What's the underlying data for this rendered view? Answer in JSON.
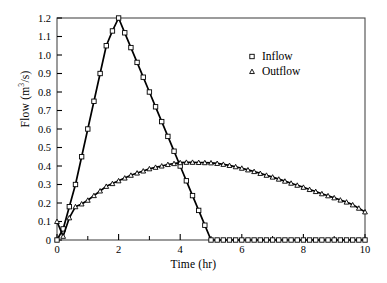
{
  "figure": {
    "background": "#ffffff",
    "foreground": "#000000"
  },
  "axis_labels": {
    "x": "Time (hr)",
    "y_prefix": "Flow (m",
    "y_exponent": "3",
    "y_suffix": "/s)",
    "y_full": "Flow (m3/s)"
  },
  "ticks": {
    "x_major": [
      "0",
      "2",
      "4",
      "6",
      "8",
      "10"
    ],
    "x_major_values": [
      0,
      2,
      4,
      6,
      8,
      10
    ],
    "x_minor_values": [
      1,
      3,
      5,
      7,
      9
    ],
    "y_major": [
      "0",
      "0.1",
      "0.2",
      "0.3",
      "0.4",
      "0.5",
      "0.6",
      "0.7",
      "0.8",
      "0.9",
      "1.0",
      "1.1",
      "1.2"
    ],
    "y_major_values": [
      0,
      0.1,
      0.2,
      0.3,
      0.4,
      0.5,
      0.6,
      0.7,
      0.8,
      0.9,
      1.0,
      1.1,
      1.2
    ]
  },
  "legend": {
    "position": "top-right-inside",
    "entries": [
      {
        "label": "Inflow",
        "marker": "square-marker"
      },
      {
        "label": "Outflow",
        "marker": "triangle-marker"
      }
    ]
  },
  "chart_data": {
    "type": "line",
    "title": "",
    "subtitle": "",
    "xlabel": "Time (hr)",
    "ylabel": "Flow (m3/s)",
    "xlim": [
      0,
      10
    ],
    "ylim": [
      0,
      1.2
    ],
    "grid": false,
    "legend_position": "top-right-inside",
    "x": [
      0,
      0.2,
      0.4,
      0.6,
      0.8,
      1.0,
      1.2,
      1.4,
      1.6,
      1.8,
      2.0,
      2.2,
      2.4,
      2.6,
      2.8,
      3.0,
      3.2,
      3.4,
      3.6,
      3.8,
      4.0,
      4.2,
      4.4,
      4.6,
      4.8,
      5.0,
      5.2,
      5.4,
      5.6,
      5.8,
      6.0,
      6.2,
      6.4,
      6.6,
      6.8,
      7.0,
      7.2,
      7.4,
      7.6,
      7.8,
      8.0,
      8.2,
      8.4,
      8.6,
      8.8,
      9.0,
      9.2,
      9.4,
      9.6,
      9.8,
      10.0
    ],
    "series": [
      {
        "name": "Inflow",
        "marker": "square-marker",
        "values": [
          0,
          0.06,
          0.18,
          0.3,
          0.45,
          0.6,
          0.75,
          0.9,
          1.05,
          1.13,
          1.2,
          1.12,
          1.04,
          0.96,
          0.88,
          0.8,
          0.72,
          0.64,
          0.56,
          0.48,
          0.4,
          0.32,
          0.24,
          0.16,
          0.08,
          0,
          0,
          0,
          0,
          0,
          0,
          0,
          0,
          0,
          0,
          0,
          0,
          0,
          0,
          0,
          0,
          0,
          0,
          0,
          0,
          0,
          0,
          0,
          0,
          0,
          0
        ]
      },
      {
        "name": "Outflow",
        "marker": "triangle-marker",
        "values": [
          0.1,
          0.02,
          0.12,
          0.18,
          0.195,
          0.215,
          0.24,
          0.265,
          0.29,
          0.305,
          0.32,
          0.335,
          0.35,
          0.362,
          0.373,
          0.385,
          0.393,
          0.4,
          0.408,
          0.413,
          0.418,
          0.42,
          0.42,
          0.419,
          0.418,
          0.417,
          0.414,
          0.409,
          0.403,
          0.396,
          0.388,
          0.379,
          0.37,
          0.36,
          0.35,
          0.34,
          0.329,
          0.318,
          0.307,
          0.296,
          0.285,
          0.273,
          0.262,
          0.25,
          0.239,
          0.228,
          0.216,
          0.205,
          0.19,
          0.172,
          0.152
        ]
      }
    ],
    "annotations": {
      "inflow_peak": {
        "x": 2.0,
        "y": 1.2
      },
      "outflow_peak": {
        "x": 4.2,
        "y": 0.42
      },
      "inflow_end": {
        "x": 5.0,
        "y": 0
      },
      "outflow_end": {
        "x": 10.0,
        "y": 0.152
      }
    }
  }
}
